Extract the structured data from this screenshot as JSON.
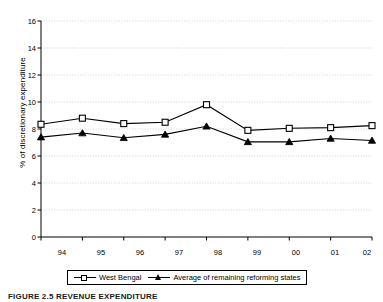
{
  "chart_data": {
    "type": "line",
    "title": "",
    "xlabel": "",
    "ylabel": "% of discretionary expenditure",
    "categories": [
      "94",
      "95",
      "96",
      "97",
      "98",
      "99",
      "00",
      "01",
      "02"
    ],
    "ylim": [
      0,
      16
    ],
    "yticks": [
      0,
      2,
      4,
      6,
      8,
      10,
      12,
      14,
      16
    ],
    "grid": "horizontal-dotted",
    "legend_position": "bottom",
    "series": [
      {
        "name": "West Bengal",
        "marker": "open-square",
        "values": [
          8.35,
          8.8,
          8.4,
          8.5,
          9.8,
          7.9,
          8.05,
          8.1,
          8.25
        ]
      },
      {
        "name": "Average of remaining reforming states",
        "marker": "filled-triangle",
        "values": [
          7.4,
          7.7,
          7.35,
          7.6,
          8.2,
          7.05,
          7.05,
          7.3,
          7.15
        ]
      }
    ]
  },
  "legend": {
    "items": [
      {
        "label": "West Bengal"
      },
      {
        "label": "Average of remaining reforming states"
      }
    ]
  },
  "caption": {
    "text": "FIGURE 2.5  REVENUE EXPENDITURE"
  },
  "colors": {
    "line": "#000000",
    "grid": "#c8c8c8",
    "axis": "#000000",
    "background": "#ffffff"
  }
}
